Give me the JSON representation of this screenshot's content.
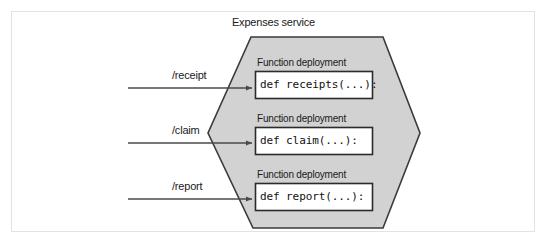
{
  "figure": {
    "kind": "serverless-architecture-diagram",
    "service": {
      "title": "Expenses service",
      "shape": "hexagon",
      "fill_color": "#d2d2d2",
      "stroke_color": "#3a3a3a"
    },
    "routes": [
      {
        "label": "/receipt"
      },
      {
        "label": "/claim"
      },
      {
        "label": "/report"
      }
    ],
    "deployments": [
      {
        "label": "Function deployment",
        "code": "def receipts(...):"
      },
      {
        "label": "Function deployment",
        "code": "def claim(...):"
      },
      {
        "label": "Function deployment",
        "code": "def report(...):"
      }
    ],
    "colors": {
      "frame": "#e2e2e2",
      "box_fill": "#ffffff",
      "box_stroke": "#2b2b2b",
      "arrow": "#4a4a4a",
      "text": "#1a1a1a"
    }
  }
}
